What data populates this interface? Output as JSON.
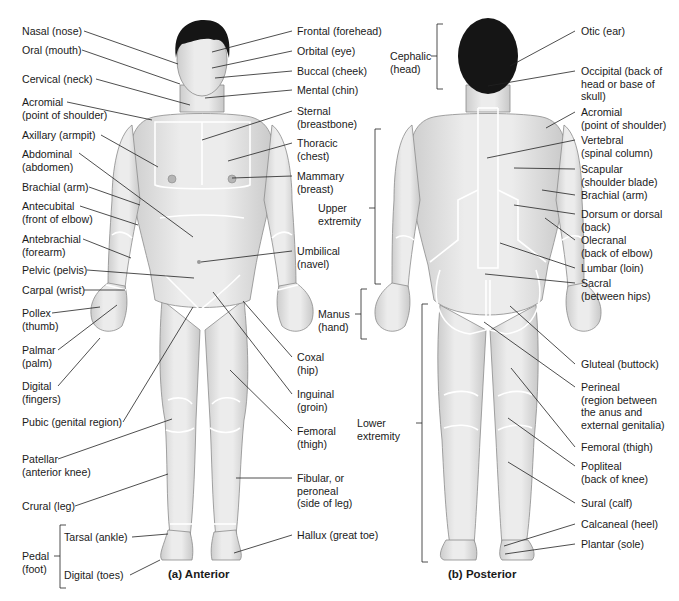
{
  "figure": {
    "anterior_caption": "(a)  Anterior",
    "posterior_caption": "(b)  Posterior"
  },
  "anterior_left_labels": [
    {
      "id": "nasal",
      "l1": "Nasal (nose)",
      "l2": ""
    },
    {
      "id": "oral",
      "l1": "Oral (mouth)",
      "l2": ""
    },
    {
      "id": "cervical",
      "l1": "Cervical (neck)",
      "l2": ""
    },
    {
      "id": "acromial",
      "l1": "Acromial",
      "l2": "(point of shoulder)"
    },
    {
      "id": "axillary",
      "l1": "Axillary (armpit)",
      "l2": ""
    },
    {
      "id": "abdominal",
      "l1": "Abdominal",
      "l2": "(abdomen)"
    },
    {
      "id": "brachial",
      "l1": "Brachial (arm)",
      "l2": ""
    },
    {
      "id": "antecubital",
      "l1": "Antecubital",
      "l2": "(front of elbow)"
    },
    {
      "id": "antebrachial",
      "l1": "Antebrachial",
      "l2": "(forearm)"
    },
    {
      "id": "pelvic",
      "l1": "Pelvic (pelvis)",
      "l2": ""
    },
    {
      "id": "carpal",
      "l1": "Carpal (wrist)",
      "l2": ""
    },
    {
      "id": "pollex",
      "l1": "Pollex",
      "l2": "(thumb)"
    },
    {
      "id": "palmar",
      "l1": "Palmar",
      "l2": "(palm)"
    },
    {
      "id": "digital",
      "l1": "Digital",
      "l2": "(fingers)"
    },
    {
      "id": "pubic",
      "l1": "Pubic (genital region)",
      "l2": ""
    },
    {
      "id": "patellar",
      "l1": "Patellar",
      "l2": "(anterior knee)"
    },
    {
      "id": "crural",
      "l1": "Crural (leg)",
      "l2": ""
    }
  ],
  "pedal": {
    "group_l1": "Pedal",
    "group_l2": "(foot)",
    "tarsal": "Tarsal (ankle)",
    "digital_toes": "Digital (toes)"
  },
  "anterior_right_labels": [
    {
      "id": "frontal",
      "l1": "Frontal (forehead)",
      "l2": ""
    },
    {
      "id": "orbital",
      "l1": "Orbital (eye)",
      "l2": ""
    },
    {
      "id": "buccal",
      "l1": "Buccal (cheek)",
      "l2": ""
    },
    {
      "id": "mental",
      "l1": "Mental (chin)",
      "l2": ""
    },
    {
      "id": "sternal",
      "l1": "Sternal",
      "l2": "(breastbone)"
    },
    {
      "id": "thoracic",
      "l1": "Thoracic",
      "l2": "(chest)"
    },
    {
      "id": "mammary",
      "l1": "Mammary",
      "l2": "(breast)"
    },
    {
      "id": "umbilical",
      "l1": "Umbilical",
      "l2": "(navel)"
    },
    {
      "id": "coxal",
      "l1": "Coxal",
      "l2": "(hip)"
    },
    {
      "id": "inguinal",
      "l1": "Inguinal",
      "l2": "(groin)"
    },
    {
      "id": "femoral_a",
      "l1": "Femoral",
      "l2": "(thigh)"
    },
    {
      "id": "fibular",
      "l1": "Fibular, or",
      "l2": "peroneal",
      "l3": "(side of leg)"
    },
    {
      "id": "hallux",
      "l1": "Hallux (great toe)",
      "l2": ""
    }
  ],
  "posterior_groups": [
    {
      "id": "cephalic",
      "l1": "Cephalic",
      "l2": "(head)"
    },
    {
      "id": "upper_extremity",
      "l1": "Upper",
      "l2": "extremity"
    },
    {
      "id": "manus",
      "l1": "Manus",
      "l2": "(hand)"
    },
    {
      "id": "lower_extremity",
      "l1": "Lower",
      "l2": "extremity"
    }
  ],
  "posterior_right_labels": [
    {
      "id": "otic",
      "l1": "Otic (ear)",
      "l2": ""
    },
    {
      "id": "occipital",
      "l1": "Occipital (back of",
      "l2": "head or base of",
      "l3": "skull)"
    },
    {
      "id": "acromial_p",
      "l1": "Acromial",
      "l2": "(point of shoulder)"
    },
    {
      "id": "vertebral",
      "l1": "Vertebral",
      "l2": "(spinal column)"
    },
    {
      "id": "scapular",
      "l1": "Scapular",
      "l2": "(shoulder blade)"
    },
    {
      "id": "brachial_p",
      "l1": "Brachial (arm)",
      "l2": ""
    },
    {
      "id": "dorsum",
      "l1": "Dorsum or dorsal",
      "l2": "(back)"
    },
    {
      "id": "olecranal",
      "l1": "Olecranal",
      "l2": "(back of elbow)"
    },
    {
      "id": "lumbar",
      "l1": "Lumbar (loin)",
      "l2": ""
    },
    {
      "id": "sacral",
      "l1": "Sacral",
      "l2": "(between hips)"
    },
    {
      "id": "gluteal",
      "l1": "Gluteal (buttock)",
      "l2": ""
    },
    {
      "id": "perineal",
      "l1": "Perineal",
      "l2": "(region between",
      "l3": "the anus and",
      "l4": "external genitalia)"
    },
    {
      "id": "femoral_p",
      "l1": "Femoral (thigh)",
      "l2": ""
    },
    {
      "id": "popliteal",
      "l1": "Popliteal",
      "l2": "(back of knee)"
    },
    {
      "id": "sural",
      "l1": "Sural (calf)",
      "l2": ""
    },
    {
      "id": "calcaneal",
      "l1": "Calcaneal (heel)",
      "l2": ""
    },
    {
      "id": "plantar",
      "l1": "Plantar (sole)",
      "l2": ""
    }
  ],
  "colors": {
    "skin": "#e6e6e6",
    "skin_shade": "#cfcfcf",
    "outline": "#8c8c8c",
    "hair": "#151515",
    "leader": "#222222",
    "region_border": "#ffffff"
  }
}
